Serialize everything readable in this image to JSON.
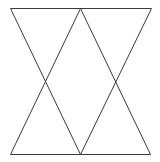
{
  "diagram": {
    "type": "geometric-line-figure",
    "background": "#ffffff",
    "stroke_color": "#3a3a3a",
    "stroke_width": 1,
    "points": {
      "A": [
        10,
        8
      ],
      "B": [
        80,
        8
      ],
      "C": [
        151,
        8
      ],
      "D": [
        10,
        154
      ],
      "E": [
        80,
        154
      ],
      "F": [
        150,
        154
      ]
    },
    "segments": [
      {
        "name": "top-edge",
        "from": "A",
        "to": "C"
      },
      {
        "name": "bottom-edge",
        "from": "D",
        "to": "F"
      },
      {
        "name": "diagonal-a-e",
        "from": "A",
        "to": "E"
      },
      {
        "name": "diagonal-b-d",
        "from": "B",
        "to": "D"
      },
      {
        "name": "diagonal-b-f",
        "from": "B",
        "to": "F"
      },
      {
        "name": "diagonal-c-e",
        "from": "C",
        "to": "E"
      }
    ]
  }
}
